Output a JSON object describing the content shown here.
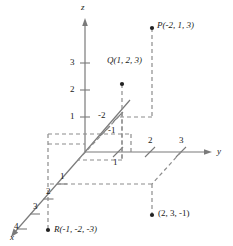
{
  "figure": {
    "type": "3d-coordinate-system-diagram",
    "background_color": "#ffffff",
    "axis_color": "#7a7a7a",
    "dashed_color": "#8c8c8c",
    "text_color": "#1a1a1a",
    "point_color": "#222222"
  },
  "axes": {
    "x": {
      "label": "x",
      "ticks": [
        "1",
        "2",
        "3",
        "4"
      ]
    },
    "y": {
      "label": "y",
      "ticks": [
        "1",
        "2",
        "3"
      ],
      "negative_ticks": [
        "-1",
        "-2"
      ]
    },
    "z": {
      "label": "z",
      "ticks": [
        "1",
        "2",
        "3"
      ]
    }
  },
  "points": [
    {
      "name": "P",
      "label": "P(-2, 1, 3)",
      "coords": [
        -2,
        1,
        3
      ]
    },
    {
      "name": "Q",
      "label": "Q(1, 2, 3)",
      "coords": [
        1,
        2,
        3
      ]
    },
    {
      "name": "R",
      "label": "R(-1, -2, -3)",
      "coords": [
        -1,
        -2,
        -3
      ]
    },
    {
      "name": "S",
      "label": "(2, 3, -1)",
      "coords": [
        2,
        3,
        -1
      ]
    }
  ],
  "tick_labels": {
    "z_3": "3",
    "z_2": "2",
    "z_1": "1",
    "y_1": "1",
    "y_2": "2",
    "y_3": "3",
    "y_neg1": "-1",
    "y_neg2": "-2",
    "x_1": "1",
    "x_2": "2",
    "x_3": "3",
    "x_4": "4"
  }
}
